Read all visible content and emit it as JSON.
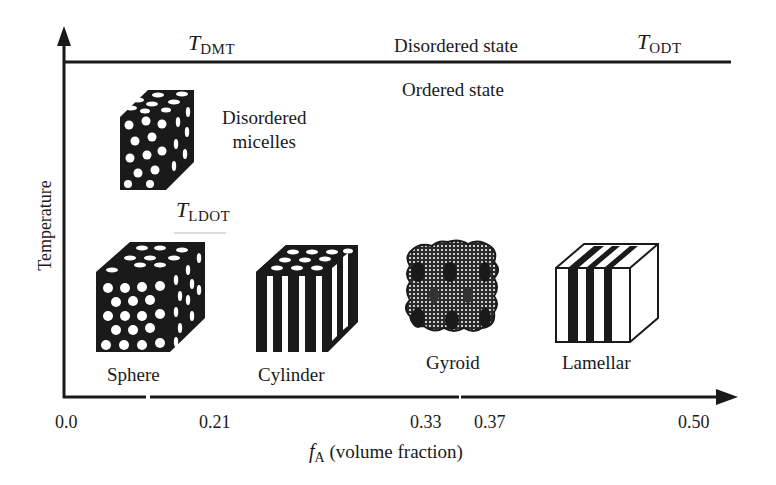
{
  "diagram": {
    "type": "phase diagram",
    "y_axis": {
      "label": "Temperature"
    },
    "x_axis": {
      "label_symbol": "f",
      "label_subscript": "A",
      "label_text": "(volume fraction)",
      "ticks": [
        "0.0",
        "0.21",
        "0.33",
        "0.37",
        "0.50"
      ]
    },
    "transitions": {
      "dmt": {
        "symbol": "T",
        "subscript": "DMT"
      },
      "odt": {
        "symbol": "T",
        "subscript": "ODT"
      },
      "ldot": {
        "symbol": "T",
        "subscript": "LDOT"
      }
    },
    "regions": {
      "disordered": "Disordered state",
      "ordered": "Ordered state"
    },
    "micelles": {
      "line1": "Disordered",
      "line2": "micelles"
    },
    "morphologies": [
      {
        "name": "Sphere"
      },
      {
        "name": "Cylinder"
      },
      {
        "name": "Gyroid"
      },
      {
        "name": "Lamellar"
      }
    ],
    "colors": {
      "ink": "#1a1a1a",
      "background": "#ffffff"
    }
  }
}
